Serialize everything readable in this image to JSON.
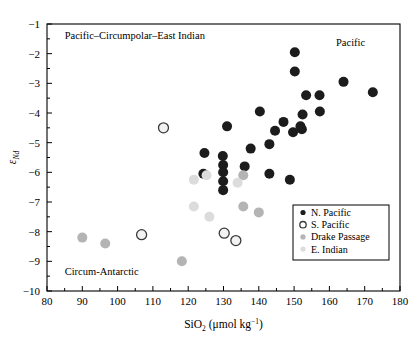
{
  "chart_data": {
    "type": "scatter",
    "title": "",
    "xlabel": "SiO2 (umol kg-1)",
    "ylabel": "eNd",
    "xlim": [
      80,
      180
    ],
    "ylim": [
      -10,
      -1
    ],
    "xticks": [
      80,
      90,
      100,
      110,
      120,
      130,
      140,
      150,
      160,
      170,
      180
    ],
    "yticks": [
      -1,
      -2,
      -3,
      -4,
      -5,
      -6,
      -7,
      -8,
      -9,
      -10
    ],
    "x_minor_tick_interval": 5,
    "y_minor_tick_interval": 0.5,
    "grid": false,
    "legend_position": "lower-right",
    "series": [
      {
        "name": "N. Pacific",
        "color": "#1c1c1c",
        "marker": "filled-circle",
        "points": [
          [
            150.2,
            -1.95
          ],
          [
            150.2,
            -2.6
          ],
          [
            164.0,
            -2.95
          ],
          [
            172.3,
            -3.3
          ],
          [
            153.4,
            -3.4
          ],
          [
            157.2,
            -3.4
          ],
          [
            157.3,
            -3.95
          ],
          [
            152.4,
            -4.05
          ],
          [
            140.3,
            -3.95
          ],
          [
            151.8,
            -4.45
          ],
          [
            152.2,
            -4.55
          ],
          [
            147.0,
            -4.3
          ],
          [
            149.7,
            -4.65
          ],
          [
            144.6,
            -4.6
          ],
          [
            131.0,
            -4.45
          ],
          [
            143.0,
            -5.05
          ],
          [
            137.7,
            -5.2
          ],
          [
            124.6,
            -5.35
          ],
          [
            129.8,
            -5.45
          ],
          [
            129.9,
            -5.75
          ],
          [
            136.0,
            -5.8
          ],
          [
            129.9,
            -6.0
          ],
          [
            143.0,
            -6.05
          ],
          [
            148.8,
            -6.25
          ],
          [
            129.9,
            -6.3
          ],
          [
            129.9,
            -6.6
          ],
          [
            124.3,
            -6.05
          ]
        ]
      },
      {
        "name": "S. Pacific",
        "color": "#3a3a3a",
        "fill": "#f2f2f2",
        "marker": "open-circle",
        "points": [
          [
            113.0,
            -4.5
          ],
          [
            106.8,
            -8.1
          ],
          [
            130.2,
            -8.05
          ],
          [
            133.5,
            -8.3
          ]
        ]
      },
      {
        "name": "Drake Passage",
        "color": "#b4b4b4",
        "marker": "filled-circle",
        "points": [
          [
            90.0,
            -8.2
          ],
          [
            96.5,
            -8.4
          ],
          [
            118.2,
            -9.0
          ],
          [
            135.6,
            -6.1
          ],
          [
            135.6,
            -7.15
          ],
          [
            140.0,
            -7.35
          ]
        ]
      },
      {
        "name": "E. Indian",
        "color": "#dcdcdc",
        "marker": "filled-circle",
        "points": [
          [
            125.2,
            -6.1
          ],
          [
            121.6,
            -6.25
          ],
          [
            134.0,
            -6.35
          ],
          [
            121.6,
            -7.15
          ],
          [
            126.0,
            -7.5
          ]
        ]
      }
    ],
    "annotations": [
      {
        "name": "pacific-circumpolar-east-indian",
        "text": "Pacific–Circumpolar–East Indian",
        "x": 85,
        "y": -1.5,
        "anchor": "start"
      },
      {
        "name": "pacific",
        "text": "Pacific",
        "x": 166,
        "y": -1.75,
        "anchor": "middle"
      },
      {
        "name": "circum-antarctic",
        "text": "Circum-Antarctic",
        "x": 85,
        "y": -9.45,
        "anchor": "start"
      }
    ]
  },
  "axes": {
    "x_title_main": "SiO",
    "x_title_sub": "2",
    "x_title_units_open": " (μmol kg",
    "x_title_units_sup": "−1",
    "x_title_units_close": ")",
    "y_title_main": "ε",
    "y_title_sub": "Nd",
    "x_tick_labels": [
      "80",
      "90",
      "100",
      "110",
      "120",
      "130",
      "140",
      "150",
      "160",
      "170",
      "180"
    ],
    "y_tick_labels": [
      "−1",
      "−2",
      "−3",
      "−4",
      "−5",
      "−6",
      "−7",
      "−8",
      "−9",
      "−10"
    ]
  },
  "legend": {
    "entries": [
      {
        "label": "N. Pacific",
        "marker": "filled-circle",
        "color": "#1c1c1c"
      },
      {
        "label": "S. Pacific",
        "marker": "open-circle",
        "color": "#3a3a3a"
      },
      {
        "label": "Drake Passage",
        "marker": "filled-circle",
        "color": "#b4b4b4"
      },
      {
        "label": "E. Indian",
        "marker": "filled-circle",
        "color": "#dcdcdc"
      }
    ]
  },
  "colors": {
    "axis": "#000000",
    "plot_border": "#000000",
    "background": "#ffffff",
    "n_pacific": "#1c1c1c",
    "s_pacific": "#3a3a3a",
    "drake_passage": "#b4b4b4",
    "e_indian": "#dcdcdc"
  }
}
